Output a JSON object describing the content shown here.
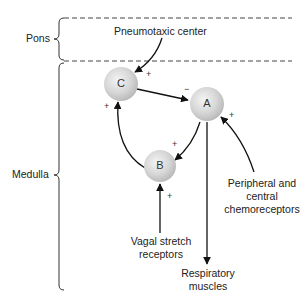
{
  "regions": {
    "pons": "Pons",
    "medulla": "Medulla"
  },
  "nodes": {
    "a": "A",
    "b": "B",
    "c": "C"
  },
  "labels": {
    "pneumotaxic": "Pneumotaxic center",
    "chemo_line1": "Peripheral and",
    "chemo_line2": "central",
    "chemo_line3": "chemoreceptors",
    "vagal_line1": "Vagal stretch",
    "vagal_line2": "receptors",
    "resp_line1": "Respiratory",
    "resp_line2": "muscles"
  },
  "signs": {
    "pneumo_to_c": "+",
    "c_to_a": "−",
    "chemo_to_a": "+",
    "a_to_b": "+",
    "b_to_c": "+",
    "vagal_to_b": "+"
  }
}
